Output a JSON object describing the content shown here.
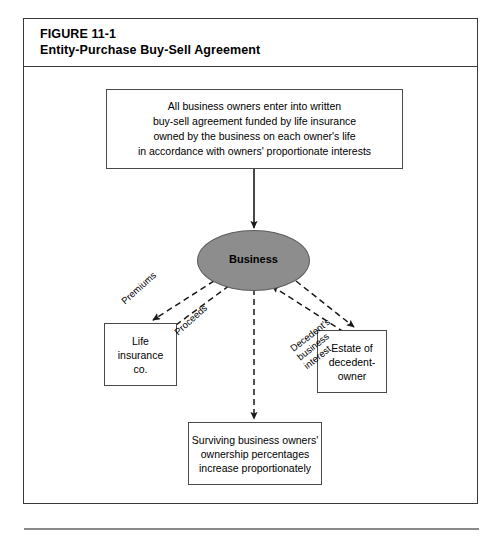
{
  "figure": {
    "number": "FIGURE 11-1",
    "title": "Entity-Purchase Buy-Sell Agreement"
  },
  "nodes": {
    "agreement": {
      "name": "agreement-box",
      "lines": [
        "All business owners enter into written",
        "buy-sell agreement funded by life insurance",
        "owned by the business on each owner's life",
        "in accordance with owners' proportionate interests"
      ]
    },
    "business": {
      "name": "business-ellipse",
      "label": "Business",
      "fill": "#8d8d8d"
    },
    "life_insurance": {
      "name": "life-insurance-box",
      "lines": [
        "Life",
        "insurance",
        "co."
      ]
    },
    "estate": {
      "name": "estate-box",
      "lines": [
        "Estate of",
        "decedent-",
        "owner"
      ]
    },
    "survivors": {
      "name": "survivors-box",
      "lines": [
        "Surviving business owners'",
        "ownership percentages",
        "increase proportionately"
      ]
    }
  },
  "edges": {
    "agreement_to_business": {
      "label": "",
      "style": "solid",
      "from": "agreement",
      "to": "business"
    },
    "premiums": {
      "label_lines": [
        "Premiums"
      ],
      "style": "dashed",
      "from": "business",
      "to": "life_insurance"
    },
    "proceeds": {
      "label_lines": [
        "Proceeds"
      ],
      "style": "dashed",
      "from": "life_insurance",
      "to": "business"
    },
    "decedent_interest": {
      "label_lines": [
        "Decedent's",
        "business",
        "interest"
      ],
      "style": "dashed",
      "from": "estate",
      "to": "business"
    },
    "payment_to_estate": {
      "label_lines": [],
      "style": "dashed",
      "from": "business",
      "to": "estate"
    },
    "business_to_survivors": {
      "label_lines": [],
      "style": "dashed",
      "from": "business",
      "to": "survivors"
    }
  },
  "colors": {
    "frame_border": "#3a3a3a",
    "box_border": "#4a4a4a",
    "ellipse_fill": "#8d8d8d",
    "rule": "#8a8a8a"
  }
}
